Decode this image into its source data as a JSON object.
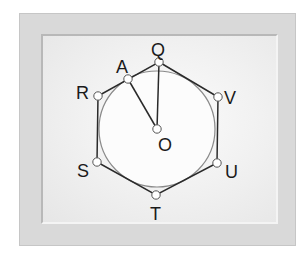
{
  "diagram": {
    "type": "geometry",
    "colors": {
      "outer_frame": "#d9d9d9",
      "inner_panel": "#f2f2f2",
      "hexagon_stroke": "#2a2a2a",
      "circle_stroke": "#8a8a8a",
      "point_fill": "#ffffff"
    },
    "labels": {
      "Q": "Q",
      "V": "V",
      "U": "U",
      "T": "T",
      "S": "S",
      "R": "R",
      "A": "A",
      "O": "O"
    },
    "points": {
      "Q": [
        159,
        62
      ],
      "V": [
        218,
        97
      ],
      "U": [
        217,
        163
      ],
      "T": [
        156,
        195
      ],
      "S": [
        97,
        162
      ],
      "R": [
        98,
        96
      ],
      "A": [
        128,
        79
      ],
      "O": [
        157,
        129
      ]
    },
    "circle": {
      "center": "O",
      "radius": 58
    },
    "segments": [
      [
        "O",
        "Q"
      ],
      [
        "O",
        "A"
      ]
    ],
    "polygon": [
      "Q",
      "V",
      "U",
      "T",
      "S",
      "R"
    ]
  }
}
